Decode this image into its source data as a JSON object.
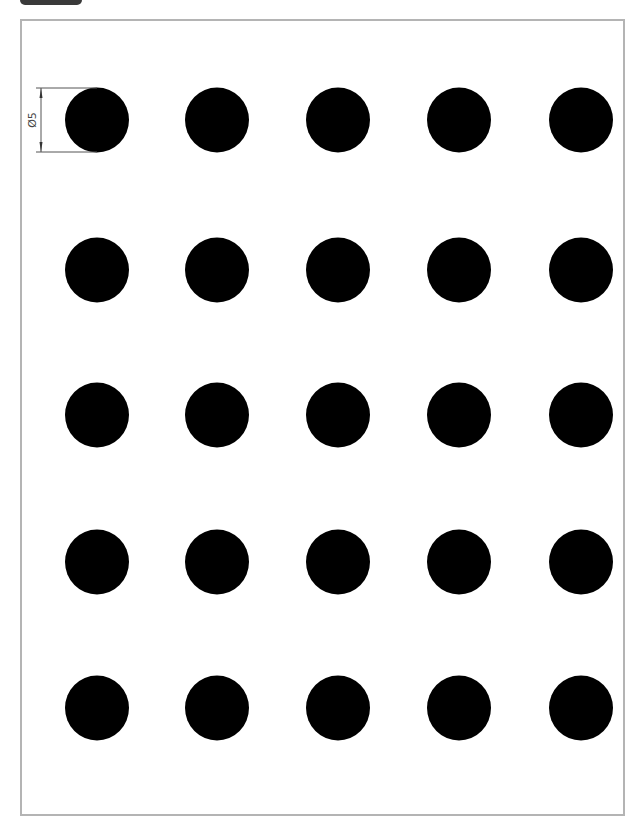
{
  "diagram": {
    "type": "technical-drawing",
    "frame": {
      "border_color": "#b4b4b4",
      "background": "#ffffff"
    },
    "dimension": {
      "label": "Ø5",
      "applies_to": "circle row 1 col 1",
      "line_color": "#555555"
    },
    "grid": {
      "rows": 5,
      "columns": 5,
      "circle_fill": "#000000",
      "column_centers_px": [
        97,
        217,
        338,
        459,
        581
      ],
      "row_centers_px": [
        120,
        270,
        415,
        562,
        708
      ],
      "circle_radius_px": 32
    }
  }
}
